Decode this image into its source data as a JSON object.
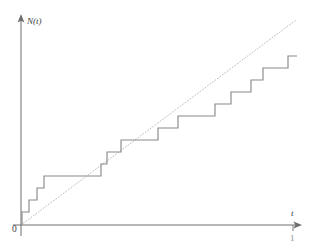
{
  "figure": {
    "name": "poisson-counting-process-figure",
    "description_visible": false
  },
  "labels": {
    "y_axis": "N(t)",
    "x_axis": "t",
    "origin": "0",
    "x_tick_one": "1"
  },
  "colors": {
    "axis": "#6e6e6e",
    "step": "#8a8a8a",
    "mean_line": "#b4b4b4",
    "text": "#3a3a3a",
    "background": "#ffffff"
  },
  "chart_data": {
    "type": "line",
    "title": "",
    "subtitle": "",
    "xlabel": "t",
    "ylabel": "N(t)",
    "xlim": [
      0,
      1.0
    ],
    "ylim": [
      0,
      15
    ],
    "grid": false,
    "legend": null,
    "xticks": [
      0,
      1
    ],
    "xticklabels": [
      "0",
      "1"
    ],
    "yticks": [],
    "yticklabels": [],
    "series": [
      {
        "name": "N(t)",
        "style": "step-post",
        "stroke": "#8a8a8a",
        "jump_times": [
          0.007,
          0.033,
          0.062,
          0.088,
          0.296,
          0.318,
          0.369,
          0.504,
          0.576,
          0.71,
          0.769,
          0.841,
          0.885,
          0.975
        ],
        "values_after_jump": [
          1,
          2,
          3,
          4,
          5,
          6,
          7,
          8,
          9,
          10,
          11,
          12,
          13,
          14
        ],
        "end_t": 1.0
      },
      {
        "name": "mean rate line",
        "style": "dotted",
        "stroke": "#b4b4b4",
        "x": [
          0,
          1.0
        ],
        "y": [
          0,
          14.6
        ],
        "note": "reference diagonal through origin"
      }
    ],
    "pixel_geometry": {
      "origin_px": [
        21,
        225
      ],
      "x_axis_end_px": [
        301,
        225
      ],
      "y_axis_top_px": [
        21,
        16
      ],
      "unit_height_px": 12.2,
      "step_jump_px": [
        22,
        29,
        37,
        44,
        101,
        107,
        121,
        158,
        178,
        215,
        231,
        251,
        263,
        288
      ],
      "step_level_px": [
        224,
        212,
        200,
        188,
        176,
        164,
        152,
        140,
        128,
        116,
        104,
        92,
        80,
        68,
        56
      ],
      "diagonal_px": [
        [
          21,
          225
        ],
        [
          296,
          20
        ]
      ]
    }
  }
}
